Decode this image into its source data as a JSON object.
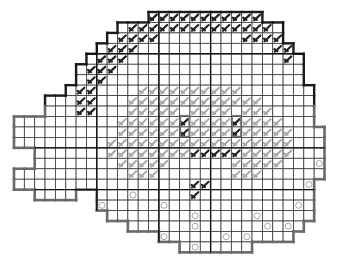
{
  "puzzle": {
    "type": "cross-stitch grid pattern",
    "grid": {
      "origin_x": 14,
      "origin_y": 12,
      "cell_w": 10.35,
      "cell_h": 10.45,
      "cols": 30,
      "rows": 23
    },
    "rows": [
      [
        13,
        24
      ],
      [
        10,
        26
      ],
      [
        9,
        26
      ],
      [
        8,
        27
      ],
      [
        7,
        28
      ],
      [
        6,
        28
      ],
      [
        6,
        28
      ],
      [
        5,
        29
      ],
      [
        3,
        29
      ],
      [
        3,
        29
      ],
      [
        0,
        29
      ],
      [
        0,
        30
      ],
      [
        0,
        30
      ],
      [
        0,
        30
      ],
      [
        0,
        30
      ],
      [
        0,
        30
      ],
      [
        0,
        29
      ],
      [
        2,
        6
      ],
      [
        8,
        29
      ],
      [
        9,
        29
      ],
      [
        11,
        28
      ],
      [
        14,
        27
      ],
      [
        16,
        23
      ]
    ],
    "extra_rows": [
      [
        21,
        {
          "from": 15,
          "to": 27
        }
      ]
    ],
    "major_lines": {
      "cols": [
        8,
        14,
        19
      ],
      "rows": [
        4,
        13,
        17
      ]
    },
    "circles": [
      [
        11,
        17
      ],
      [
        17,
        19
      ],
      [
        23,
        19
      ],
      [
        28,
        16
      ],
      [
        8,
        18
      ],
      [
        14,
        18
      ],
      [
        17,
        20
      ],
      [
        26,
        20
      ],
      [
        5,
        21
      ],
      [
        11,
        21
      ],
      [
        24,
        20
      ],
      [
        29,
        14
      ],
      [
        27,
        18
      ],
      [
        29,
        18
      ],
      [
        14,
        21
      ],
      [
        20,
        21
      ],
      [
        22,
        21
      ],
      [
        28,
        21
      ],
      [
        17,
        22
      ],
      [
        23,
        22
      ]
    ],
    "dark_stitches": [
      [
        13,
        0
      ],
      [
        14,
        0
      ],
      [
        15,
        0
      ],
      [
        16,
        0
      ],
      [
        17,
        0
      ],
      [
        18,
        0
      ],
      [
        19,
        0
      ],
      [
        20,
        0
      ],
      [
        21,
        0
      ],
      [
        22,
        0
      ],
      [
        23,
        0
      ],
      [
        11,
        1
      ],
      [
        12,
        1
      ],
      [
        13,
        1
      ],
      [
        14,
        1
      ],
      [
        15,
        1
      ],
      [
        16,
        1
      ],
      [
        17,
        1
      ],
      [
        18,
        1
      ],
      [
        19,
        1
      ],
      [
        20,
        1
      ],
      [
        21,
        1
      ],
      [
        22,
        1
      ],
      [
        23,
        1
      ],
      [
        24,
        1
      ],
      [
        10,
        2
      ],
      [
        11,
        2
      ],
      [
        12,
        2
      ],
      [
        13,
        2
      ],
      [
        22,
        2
      ],
      [
        23,
        2
      ],
      [
        24,
        2
      ],
      [
        25,
        2
      ],
      [
        9,
        3
      ],
      [
        10,
        3
      ],
      [
        11,
        3
      ],
      [
        25,
        3
      ],
      [
        26,
        3
      ],
      [
        8,
        4
      ],
      [
        9,
        4
      ],
      [
        10,
        4
      ],
      [
        26,
        4
      ],
      [
        7,
        5
      ],
      [
        8,
        5
      ],
      [
        9,
        5
      ],
      [
        7,
        6
      ],
      [
        8,
        6
      ],
      [
        6,
        7
      ],
      [
        7,
        7
      ],
      [
        6,
        8
      ],
      [
        7,
        8
      ],
      [
        6,
        9
      ],
      [
        7,
        9
      ],
      [
        16,
        10
      ],
      [
        16,
        11
      ],
      [
        21,
        10
      ],
      [
        21,
        11
      ],
      [
        17,
        13
      ],
      [
        18,
        13
      ],
      [
        19,
        13
      ],
      [
        20,
        13
      ],
      [
        21,
        13
      ],
      [
        17,
        16
      ],
      [
        18,
        16
      ],
      [
        17,
        17
      ]
    ],
    "light_stitches": [
      [
        11,
        9
      ],
      [
        12,
        9
      ],
      [
        13,
        9
      ],
      [
        14,
        9
      ],
      [
        15,
        9
      ],
      [
        17,
        9
      ],
      [
        18,
        9
      ],
      [
        19,
        9
      ],
      [
        20,
        9
      ],
      [
        22,
        9
      ],
      [
        23,
        9
      ],
      [
        24,
        9
      ],
      [
        10,
        10
      ],
      [
        11,
        10
      ],
      [
        12,
        10
      ],
      [
        13,
        10
      ],
      [
        14,
        10
      ],
      [
        15,
        10
      ],
      [
        17,
        10
      ],
      [
        18,
        10
      ],
      [
        19,
        10
      ],
      [
        20,
        10
      ],
      [
        22,
        10
      ],
      [
        23,
        10
      ],
      [
        24,
        10
      ],
      [
        25,
        10
      ],
      [
        10,
        11
      ],
      [
        11,
        11
      ],
      [
        12,
        11
      ],
      [
        13,
        11
      ],
      [
        14,
        11
      ],
      [
        15,
        11
      ],
      [
        17,
        11
      ],
      [
        18,
        11
      ],
      [
        19,
        11
      ],
      [
        20,
        11
      ],
      [
        22,
        11
      ],
      [
        23,
        11
      ],
      [
        24,
        11
      ],
      [
        25,
        11
      ],
      [
        26,
        11
      ],
      [
        9,
        12
      ],
      [
        10,
        12
      ],
      [
        11,
        12
      ],
      [
        12,
        12
      ],
      [
        13,
        12
      ],
      [
        14,
        12
      ],
      [
        15,
        12
      ],
      [
        16,
        12
      ],
      [
        17,
        12
      ],
      [
        18,
        12
      ],
      [
        19,
        12
      ],
      [
        20,
        12
      ],
      [
        21,
        12
      ],
      [
        22,
        12
      ],
      [
        23,
        12
      ],
      [
        24,
        12
      ],
      [
        25,
        12
      ],
      [
        26,
        12
      ],
      [
        9,
        13
      ],
      [
        10,
        13
      ],
      [
        11,
        13
      ],
      [
        12,
        13
      ],
      [
        13,
        13
      ],
      [
        14,
        13
      ],
      [
        15,
        13
      ],
      [
        16,
        13
      ],
      [
        22,
        13
      ],
      [
        23,
        13
      ],
      [
        24,
        13
      ],
      [
        25,
        13
      ],
      [
        26,
        13
      ],
      [
        10,
        14
      ],
      [
        11,
        14
      ],
      [
        12,
        14
      ],
      [
        13,
        14
      ],
      [
        14,
        14
      ],
      [
        21,
        14
      ],
      [
        22,
        14
      ],
      [
        23,
        14
      ],
      [
        24,
        14
      ],
      [
        25,
        14
      ],
      [
        11,
        15
      ],
      [
        12,
        15
      ],
      [
        13,
        15
      ],
      [
        21,
        15
      ],
      [
        22,
        15
      ],
      [
        23,
        15
      ],
      [
        12,
        7
      ],
      [
        13,
        7
      ],
      [
        14,
        7
      ],
      [
        15,
        7
      ],
      [
        16,
        7
      ],
      [
        17,
        7
      ],
      [
        18,
        7
      ],
      [
        19,
        7
      ],
      [
        20,
        7
      ],
      [
        21,
        7
      ],
      [
        11,
        8
      ],
      [
        12,
        8
      ],
      [
        13,
        8
      ],
      [
        14,
        8
      ],
      [
        15,
        8
      ],
      [
        16,
        8
      ],
      [
        17,
        8
      ],
      [
        18,
        8
      ],
      [
        19,
        8
      ],
      [
        20,
        8
      ],
      [
        21,
        8
      ],
      [
        22,
        8
      ],
      [
        23,
        8
      ]
    ]
  }
}
